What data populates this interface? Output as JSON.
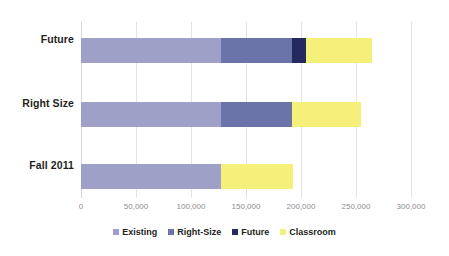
{
  "chart_data": {
    "type": "bar",
    "orientation": "horizontal",
    "stacked": true,
    "title": "",
    "subtitle": "",
    "xlabel": "",
    "ylabel": "",
    "categories": [
      "Fall 2011",
      "Right Size",
      "Future"
    ],
    "series": [
      {
        "name": "Existing",
        "color": "#9fa0c8",
        "values": [
          127000,
          127000,
          127000
        ]
      },
      {
        "name": "Right-Size",
        "color": "#6b74a8",
        "values": [
          0,
          65000,
          65000
        ]
      },
      {
        "name": "Future",
        "color": "#252a5e",
        "values": [
          0,
          0,
          13000
        ]
      },
      {
        "name": "Classroom",
        "color": "#f4f07a",
        "values": [
          66000,
          62500,
          60000
        ]
      }
    ],
    "totals": [
      193000,
      254500,
      265000
    ],
    "xlim": [
      0,
      300000
    ],
    "xticks": [
      0,
      50000,
      100000,
      150000,
      200000,
      250000,
      300000
    ],
    "xtick_labels": [
      "0",
      "50,000",
      "100,000",
      "150,000",
      "200,000",
      "250,000",
      "300,000"
    ],
    "grid": true,
    "grid_axis": "x",
    "legend_position": "bottom",
    "legend_entries": [
      "Existing",
      "Right-Size",
      "Future",
      "Classroom"
    ]
  },
  "colors": {
    "existing": "#9fa0c8",
    "right_size": "#6b74a8",
    "future": "#252a5e",
    "classroom": "#f4f07a",
    "gridline": "#e3e3e6",
    "axis_text": "#8d8d92",
    "label_text": "#231f20",
    "background": "#ffffff"
  },
  "axis": {
    "x_tick_0": "0",
    "x_tick_1": "50,000",
    "x_tick_2": "100,000",
    "x_tick_3": "150,000",
    "x_tick_4": "200,000",
    "x_tick_5": "250,000",
    "x_tick_6": "300,000"
  },
  "categories": {
    "top": "Future",
    "middle": "Right Size",
    "bottom": "Fall 2011"
  },
  "legend": {
    "existing": "Existing",
    "right_size": "Right-Size",
    "future": "Future",
    "classroom": "Classroom"
  }
}
